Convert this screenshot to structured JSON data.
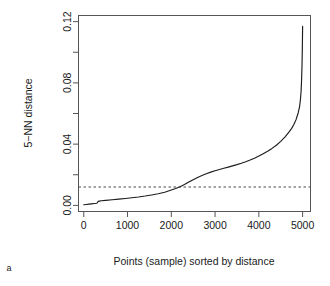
{
  "panel": {
    "label": "a"
  },
  "chart_data": {
    "type": "line",
    "title": "",
    "subtitle": "",
    "xlabel": "Points (sample) sorted by distance",
    "ylabel": "5−NN distance",
    "xlim": [
      -120,
      5180
    ],
    "ylim": [
      -0.004,
      0.124
    ],
    "xticks": [
      0,
      1000,
      2000,
      3000,
      4000,
      5000
    ],
    "xtick_labels": [
      "0",
      "1000",
      "2000",
      "3000",
      "4000",
      "5000"
    ],
    "yticks": [
      0.0,
      0.02,
      0.04,
      0.06,
      0.08,
      0.1,
      0.12
    ],
    "ytick_labels": [
      "0.00",
      "",
      "0.04",
      "",
      "0.08",
      "",
      "0.12"
    ],
    "grid": false,
    "legend": null,
    "annotations": [
      {
        "kind": "horizontal-dashed-line",
        "name": "epsilon-threshold",
        "y": 0.012,
        "style": "dashed"
      }
    ],
    "series": [
      {
        "name": "5-NN distance (sorted)",
        "color": "#1c1c1c",
        "x": [
          0,
          60,
          120,
          180,
          240,
          300,
          330,
          360,
          400,
          500,
          650,
          800,
          950,
          1100,
          1250,
          1400,
          1550,
          1700,
          1850,
          2000,
          2100,
          2200,
          2300,
          2400,
          2500,
          2600,
          2700,
          2800,
          2900,
          3000,
          3100,
          3200,
          3300,
          3400,
          3500,
          3600,
          3700,
          3800,
          3900,
          4000,
          4100,
          4200,
          4300,
          4400,
          4500,
          4600,
          4700,
          4750,
          4800,
          4850,
          4900,
          4930,
          4950,
          4965,
          4975,
          4985,
          4992,
          4997,
          5000
        ],
        "y": [
          0.0004,
          0.0006,
          0.0008,
          0.001,
          0.0012,
          0.0014,
          0.0026,
          0.0028,
          0.003,
          0.0033,
          0.0037,
          0.0041,
          0.0045,
          0.005,
          0.0055,
          0.0061,
          0.0068,
          0.0076,
          0.0086,
          0.01,
          0.011,
          0.0122,
          0.0136,
          0.0152,
          0.0168,
          0.0182,
          0.0195,
          0.0207,
          0.0217,
          0.0226,
          0.0234,
          0.0242,
          0.025,
          0.0258,
          0.0266,
          0.0275,
          0.0285,
          0.0296,
          0.0308,
          0.0322,
          0.0337,
          0.0353,
          0.0372,
          0.0393,
          0.0418,
          0.0447,
          0.0483,
          0.0503,
          0.0528,
          0.056,
          0.0605,
          0.0645,
          0.069,
          0.0745,
          0.081,
          0.09,
          0.1,
          0.11,
          0.117
        ]
      }
    ]
  }
}
